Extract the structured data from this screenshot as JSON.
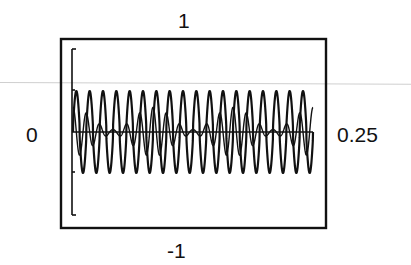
{
  "chart_data": {
    "type": "line",
    "title": "",
    "xlabel": "",
    "ylabel": "",
    "x_range": [
      0,
      0.25
    ],
    "y_range": [
      -1,
      1
    ],
    "tick_labels": {
      "top": "1",
      "bottom": "-1",
      "left": "0",
      "right": "0.25"
    },
    "grid": false,
    "legend": null,
    "series": [
      {
        "name": "waveform",
        "description": "periodic oscillating signal with ~18 cycles, amplitude about 0.45, beating envelope",
        "cycles": 18,
        "amplitude": 0.45
      }
    ],
    "annotations": [
      "vertical bracket on left axis spanning approx -0.85 to 0.85"
    ]
  },
  "labels": {
    "top": "1",
    "bottom": "-1",
    "left": "0",
    "right": "0.25"
  },
  "colors": {
    "ink": "#111111",
    "background": "#ffffff",
    "scanline": "#cfcfcf"
  }
}
